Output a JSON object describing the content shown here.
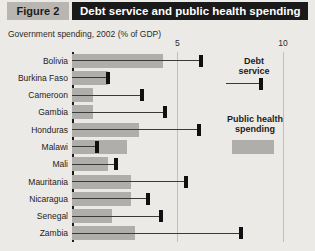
{
  "header": {
    "figure_badge": "Figure 2",
    "title": "Debt service and public health spending"
  },
  "subtitle": "Government spending, 2002 (% of GDP)",
  "legend": {
    "debt_service": "Debt\nservice",
    "debt_service_line1": "Debt",
    "debt_service_line2": "service",
    "public_health_line1": "Public health",
    "public_health_line2": "spending"
  },
  "colors": {
    "panel_background": "#eceae6",
    "title_bar": "#1a1a1a",
    "title_text": "#ffffff",
    "figure_badge": "#b9b6b1",
    "health_bar": "#b0aeaa",
    "debt_marker": "#101010",
    "debt_line": "#3a3a3a",
    "gridline": "#c2bfba",
    "axis": "#1c1c1c"
  },
  "chart_data": {
    "type": "bar",
    "title": "Debt service and public health spending",
    "subtitle": "Government spending, 2002 (% of GDP)",
    "xlabel": "",
    "ylabel": "",
    "xlim": [
      0,
      11
    ],
    "ticks": [
      5,
      10
    ],
    "tick_labels": [
      "5",
      "10"
    ],
    "grid": true,
    "orientation": "horizontal",
    "legend_position": "right",
    "categories": [
      "Bolivia",
      "Burkina Faso",
      "Cameroon",
      "Gambia",
      "Honduras",
      "Malawi",
      "Mali",
      "Mauritania",
      "Nicaragua",
      "Senegal",
      "Zambia"
    ],
    "series": [
      {
        "name": "Public health spending",
        "type": "bar",
        "values": [
          4.3,
          1.7,
          1.0,
          1.0,
          3.2,
          2.6,
          1.7,
          2.8,
          2.8,
          1.9,
          3.0
        ]
      },
      {
        "name": "Debt service",
        "type": "marker",
        "values": [
          6.1,
          1.7,
          3.3,
          4.4,
          6.0,
          1.2,
          2.1,
          5.4,
          3.6,
          4.2,
          8.0
        ]
      }
    ]
  }
}
